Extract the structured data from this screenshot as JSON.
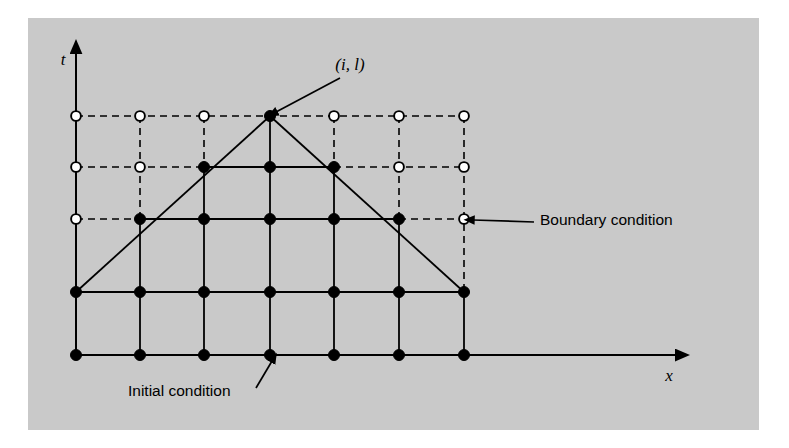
{
  "figure": {
    "background_color": "#ffffff",
    "plate_color": "#c9c9c9",
    "ink_color": "#000000"
  },
  "axes": {
    "t_label": "t",
    "x_label": "x",
    "t_axis_x": 76,
    "t_axis_top_y": 52,
    "t_axis_bottom_y": 355,
    "x_axis_y": 355,
    "x_axis_left_x": 76,
    "x_axis_right_x": 677
  },
  "grid": {
    "columns_x": [
      76,
      140,
      204,
      270,
      334,
      399,
      464
    ],
    "rows_y": [
      116,
      167,
      219,
      292,
      355
    ],
    "n_columns": 7,
    "n_rows": 5,
    "filled_node_color": "#000000",
    "open_node_fill": "#ffffff",
    "open_node_stroke": "#000000",
    "node_radius": 5.5,
    "solid_line_width": 1.8,
    "dashed_line_width": 1.6,
    "dash_pattern": "7,5"
  },
  "nodes": [
    {
      "row": 0,
      "col": 0,
      "type": "open"
    },
    {
      "row": 0,
      "col": 1,
      "type": "open"
    },
    {
      "row": 0,
      "col": 2,
      "type": "open"
    },
    {
      "row": 0,
      "col": 3,
      "type": "filled"
    },
    {
      "row": 0,
      "col": 4,
      "type": "open"
    },
    {
      "row": 0,
      "col": 5,
      "type": "open"
    },
    {
      "row": 0,
      "col": 6,
      "type": "open"
    },
    {
      "row": 1,
      "col": 0,
      "type": "open"
    },
    {
      "row": 1,
      "col": 1,
      "type": "open"
    },
    {
      "row": 1,
      "col": 2,
      "type": "filled"
    },
    {
      "row": 1,
      "col": 3,
      "type": "filled"
    },
    {
      "row": 1,
      "col": 4,
      "type": "filled"
    },
    {
      "row": 1,
      "col": 5,
      "type": "open"
    },
    {
      "row": 1,
      "col": 6,
      "type": "open"
    },
    {
      "row": 2,
      "col": 0,
      "type": "open"
    },
    {
      "row": 2,
      "col": 1,
      "type": "filled"
    },
    {
      "row": 2,
      "col": 2,
      "type": "filled"
    },
    {
      "row": 2,
      "col": 3,
      "type": "filled"
    },
    {
      "row": 2,
      "col": 4,
      "type": "filled"
    },
    {
      "row": 2,
      "col": 5,
      "type": "filled"
    },
    {
      "row": 2,
      "col": 6,
      "type": "open"
    },
    {
      "row": 3,
      "col": 0,
      "type": "filled"
    },
    {
      "row": 3,
      "col": 1,
      "type": "filled"
    },
    {
      "row": 3,
      "col": 2,
      "type": "filled"
    },
    {
      "row": 3,
      "col": 3,
      "type": "filled"
    },
    {
      "row": 3,
      "col": 4,
      "type": "filled"
    },
    {
      "row": 3,
      "col": 5,
      "type": "filled"
    },
    {
      "row": 3,
      "col": 6,
      "type": "filled"
    },
    {
      "row": 4,
      "col": 0,
      "type": "filled"
    },
    {
      "row": 4,
      "col": 1,
      "type": "filled"
    },
    {
      "row": 4,
      "col": 2,
      "type": "filled"
    },
    {
      "row": 4,
      "col": 3,
      "type": "filled"
    },
    {
      "row": 4,
      "col": 4,
      "type": "filled"
    },
    {
      "row": 4,
      "col": 5,
      "type": "filled"
    },
    {
      "row": 4,
      "col": 6,
      "type": "filled"
    }
  ],
  "horizontal_segments": [
    {
      "row": 0,
      "from_col": 0,
      "to_col": 6,
      "style": "dashed"
    },
    {
      "row": 1,
      "from_col": 0,
      "to_col": 2,
      "style": "dashed"
    },
    {
      "row": 1,
      "from_col": 2,
      "to_col": 4,
      "style": "solid"
    },
    {
      "row": 1,
      "from_col": 4,
      "to_col": 6,
      "style": "dashed"
    },
    {
      "row": 2,
      "from_col": 0,
      "to_col": 1,
      "style": "dashed"
    },
    {
      "row": 2,
      "from_col": 1,
      "to_col": 5,
      "style": "solid"
    },
    {
      "row": 2,
      "from_col": 5,
      "to_col": 6,
      "style": "dashed"
    },
    {
      "row": 3,
      "from_col": 0,
      "to_col": 6,
      "style": "solid"
    },
    {
      "row": 4,
      "from_col": 0,
      "to_col": 6,
      "style": "solid"
    }
  ],
  "vertical_segments": [
    {
      "col": 0,
      "from_row": 0,
      "to_row": 3,
      "style": "dashed"
    },
    {
      "col": 0,
      "from_row": 3,
      "to_row": 4,
      "style": "solid"
    },
    {
      "col": 1,
      "from_row": 0,
      "to_row": 2,
      "style": "dashed"
    },
    {
      "col": 1,
      "from_row": 2,
      "to_row": 4,
      "style": "solid"
    },
    {
      "col": 2,
      "from_row": 0,
      "to_row": 1,
      "style": "dashed"
    },
    {
      "col": 2,
      "from_row": 1,
      "to_row": 4,
      "style": "solid"
    },
    {
      "col": 3,
      "from_row": 0,
      "to_row": 4,
      "style": "solid"
    },
    {
      "col": 4,
      "from_row": 0,
      "to_row": 1,
      "style": "dashed"
    },
    {
      "col": 4,
      "from_row": 1,
      "to_row": 4,
      "style": "solid"
    },
    {
      "col": 5,
      "from_row": 0,
      "to_row": 2,
      "style": "dashed"
    },
    {
      "col": 5,
      "from_row": 2,
      "to_row": 4,
      "style": "solid"
    },
    {
      "col": 6,
      "from_row": 0,
      "to_row": 3,
      "style": "dashed"
    },
    {
      "col": 6,
      "from_row": 3,
      "to_row": 4,
      "style": "solid"
    }
  ],
  "characteristic_lines": [
    {
      "name": "left-characteristic",
      "from": {
        "row": 3,
        "col": 0
      },
      "to": {
        "row": 0,
        "col": 3
      },
      "style": "solid"
    },
    {
      "name": "right-characteristic",
      "from": {
        "row": 0,
        "col": 3
      },
      "to": {
        "row": 3,
        "col": 6
      },
      "style": "solid"
    }
  ],
  "annotations": {
    "apex_point": {
      "label": "(i, l)",
      "text_x": 350,
      "text_y": 70,
      "arrow_from": {
        "x": 340,
        "y": 78
      },
      "arrow_to": {
        "x": 276,
        "y": 112
      }
    },
    "boundary_condition": {
      "label": "Boundary condition",
      "text_x": 540,
      "text_y": 225,
      "arrow_from": {
        "x": 534,
        "y": 222
      },
      "arrow_to": {
        "x": 473,
        "y": 220
      }
    },
    "initial_condition": {
      "label": "Initial condition",
      "text_x": 128,
      "text_y": 396,
      "arrow_from": {
        "x": 256,
        "y": 388
      },
      "arrow_to": {
        "x": 272,
        "y": 361
      }
    }
  }
}
